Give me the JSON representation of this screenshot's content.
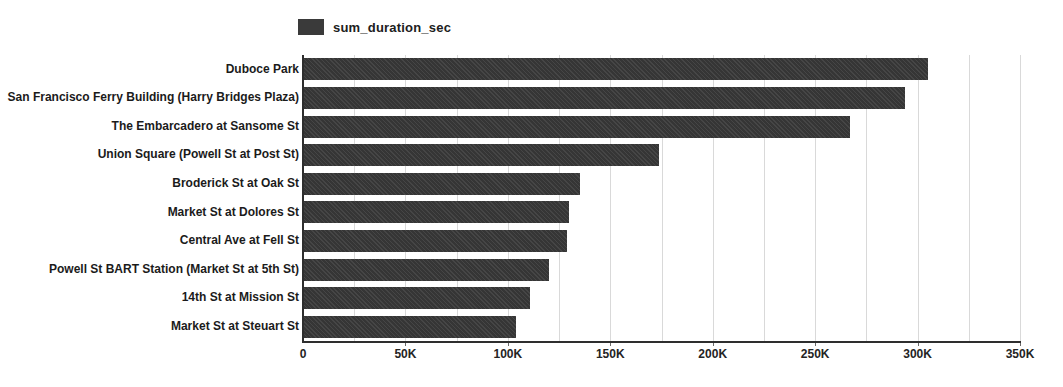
{
  "chart_data": {
    "type": "bar",
    "orientation": "horizontal",
    "title": "",
    "legend": "sum_duration_sec",
    "legend_position": "top",
    "categories": [
      "Duboce Park",
      "San Francisco Ferry Building (Harry Bridges Plaza)",
      "The Embarcadero at Sansome St",
      "Union Square (Powell St at Post St)",
      "Broderick St at Oak St",
      "Market St at Dolores St",
      "Central Ave at Fell St",
      "Powell St BART Station (Market St at 5th St)",
      "14th St at Mission St",
      "Market St at Steuart St"
    ],
    "values": [
      305000,
      294000,
      267000,
      174000,
      135000,
      130000,
      129000,
      120000,
      111000,
      104000
    ],
    "xlabel": "",
    "ylabel": "",
    "xlim": [
      0,
      350000
    ],
    "x_ticks": [
      {
        "value": 0,
        "label": "0"
      },
      {
        "value": 50000,
        "label": "50K"
      },
      {
        "value": 100000,
        "label": "100K"
      },
      {
        "value": 150000,
        "label": "150K"
      },
      {
        "value": 200000,
        "label": "200K"
      },
      {
        "value": 250000,
        "label": "250K"
      },
      {
        "value": 300000,
        "label": "300K"
      },
      {
        "value": 350000,
        "label": "350K"
      }
    ],
    "minor_gridline_interval": 25000,
    "grid": true,
    "colors": {
      "bar": "#3a3a3a",
      "gridline": "#d9d9d9",
      "axis": "#2e2e2e",
      "text": "#1b1b1b",
      "background": "#ffffff"
    }
  }
}
